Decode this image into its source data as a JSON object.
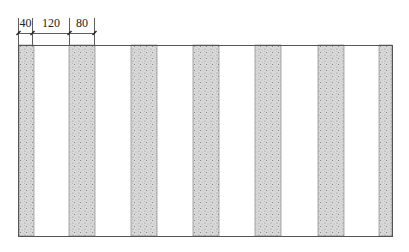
{
  "diagram": {
    "dimensions": [
      {
        "label": "40",
        "x1": 18,
        "x2": 32
      },
      {
        "label": "120",
        "x1": 32,
        "x2": 69
      },
      {
        "label": "80",
        "x1": 69,
        "x2": 94
      }
    ],
    "frame": {
      "x": 18,
      "y": 45,
      "width": 374,
      "height": 191
    },
    "strips": [
      {
        "x": 19,
        "width": 15
      },
      {
        "x": 69,
        "width": 26
      },
      {
        "x": 131,
        "width": 26
      },
      {
        "x": 193,
        "width": 26
      },
      {
        "x": 255,
        "width": 26
      },
      {
        "x": 318,
        "width": 26
      },
      {
        "x": 379,
        "width": 13
      }
    ],
    "colors": {
      "line": "#444444",
      "strip_fill": "#d6d6d6",
      "strip_speckle": "#8a8a8a",
      "background": "#ffffff"
    }
  }
}
